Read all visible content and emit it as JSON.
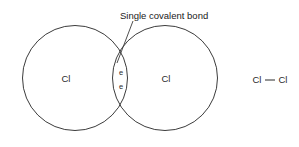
{
  "diagram": {
    "annotation": {
      "text": "Single covalent bond",
      "x": 120,
      "y": 19
    },
    "leader": {
      "name": "leader-line",
      "x1": 133,
      "y1": 21,
      "x2": 117,
      "y2": 63
    },
    "atoms": [
      {
        "id": "left-atom",
        "label": "Cl",
        "cx": 75,
        "cy": 78,
        "r": 52.5,
        "label_x": 66,
        "label_y": 79
      },
      {
        "id": "right-atom",
        "label": "Cl",
        "cx": 165,
        "cy": 78,
        "r": 52.5,
        "label_x": 166,
        "label_y": 79
      }
    ],
    "electrons": [
      {
        "label": "e",
        "x": 121,
        "y": 73
      },
      {
        "label": "e",
        "x": 121,
        "y": 87
      }
    ],
    "formula": {
      "left_symbol": "Cl",
      "right_symbol": "Cl",
      "bond_glyph": "—",
      "left_x": 257,
      "right_x": 283,
      "y": 80,
      "bond_x1": 265,
      "bond_x2": 275,
      "bond_y": 80
    },
    "colors": {
      "background": "#ffffff",
      "stroke": "#3c3c3c",
      "text": "#1a1a1a",
      "label_text": "#2a2a2a"
    }
  }
}
